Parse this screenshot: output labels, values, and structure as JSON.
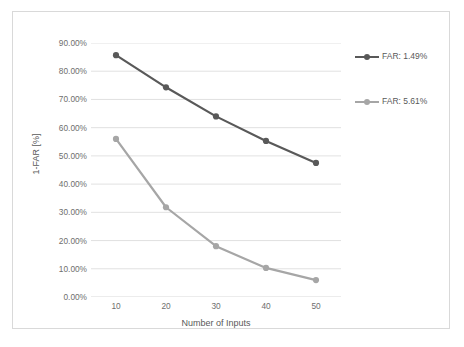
{
  "chart_data": {
    "type": "line",
    "title": "",
    "xlabel": "Number of Inputs",
    "ylabel": "1-FAR [%]",
    "x": [
      10,
      20,
      30,
      40,
      50
    ],
    "categories": [
      "10",
      "20",
      "30",
      "40",
      "50"
    ],
    "xtick_labels": [
      "10",
      "20",
      "30",
      "40",
      "50"
    ],
    "ytick_labels": [
      "0.00%",
      "10.00%",
      "20.00%",
      "30.00%",
      "40.00%",
      "50.00%",
      "60.00%",
      "70.00%",
      "80.00%",
      "90.00%"
    ],
    "ytick_values": [
      0,
      10,
      20,
      30,
      40,
      50,
      60,
      70,
      80,
      90
    ],
    "ylim": [
      0,
      90
    ],
    "xlim": [
      5,
      55
    ],
    "grid": "horizontal",
    "legend_position": "right",
    "series": [
      {
        "name": "FAR: 1.49%",
        "color": "#595959",
        "marker": "circle",
        "values": [
          85.7,
          74.3,
          64.0,
          55.3,
          47.5
        ]
      },
      {
        "name": "FAR: 5.61%",
        "color": "#a6a6a6",
        "marker": "circle",
        "values": [
          56.0,
          31.8,
          18.0,
          10.3,
          6.0
        ]
      }
    ]
  },
  "legend": {
    "entries": [
      {
        "label": "FAR: 1.49%"
      },
      {
        "label": "FAR: 5.61%"
      }
    ]
  },
  "axes": {
    "x_title": "Number of Inputs",
    "y_title": "1-FAR [%]"
  },
  "colors": {
    "series_dark": "#595959",
    "series_light": "#a6a6a6",
    "gridline": "#d9d9d9",
    "frame": "#d9d9d9",
    "text": "#6e6e6e",
    "background": "#ffffff"
  }
}
